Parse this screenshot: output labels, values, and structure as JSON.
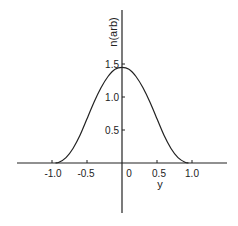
{
  "chart_data": {
    "type": "line",
    "title": "",
    "xlabel": "y",
    "ylabel": "n(arb)",
    "xlim": [
      -1.5,
      1.5
    ],
    "ylim": [
      -0.75,
      2.3
    ],
    "grid": false,
    "legend": null,
    "x_ticks": [
      "-1.0",
      "-0.5",
      "0",
      "0.5",
      "1.0"
    ],
    "y_ticks": [
      "0.5",
      "1.0",
      "1.5"
    ],
    "series": [
      {
        "name": "n(y)",
        "x": [
          -0.95,
          -0.9,
          -0.8,
          -0.7,
          -0.6,
          -0.5,
          -0.4,
          -0.3,
          -0.2,
          -0.1,
          0.0,
          0.1,
          0.2,
          0.3,
          0.4,
          0.5,
          0.6,
          0.7,
          0.8,
          0.9,
          0.95
        ],
        "y": [
          0.0,
          0.01,
          0.08,
          0.22,
          0.42,
          0.67,
          0.92,
          1.14,
          1.31,
          1.42,
          1.45,
          1.42,
          1.31,
          1.14,
          0.92,
          0.67,
          0.42,
          0.22,
          0.08,
          0.01,
          0.0
        ]
      }
    ]
  },
  "labels": {
    "xlabel": "y",
    "ylabel": "n(arb)",
    "xticks": [
      "-1.0",
      "-0.5",
      "0",
      "0.5",
      "1.0"
    ],
    "yticks": [
      "0.5",
      "1.0",
      "1.5"
    ]
  }
}
